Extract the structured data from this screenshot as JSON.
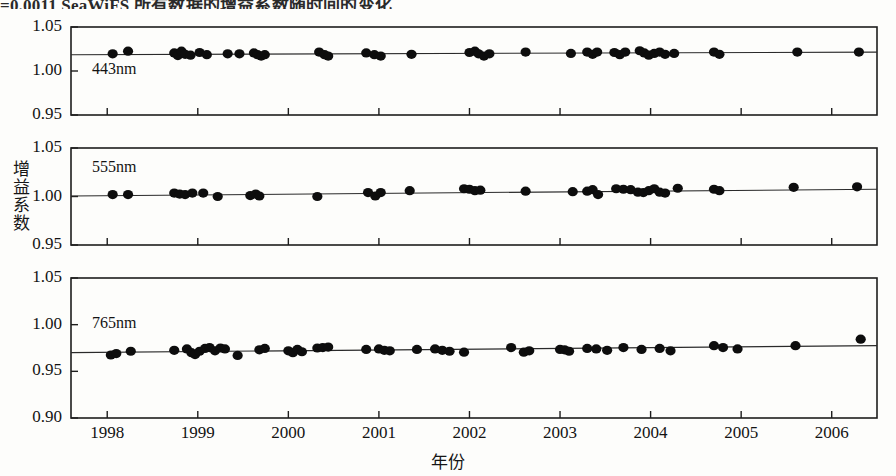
{
  "caption_fragment": "=0.0011  SeaWiFS 所有数据的增益系数随时间的变化",
  "axes": {
    "y_label": "增益系数",
    "x_label": "年份",
    "x_ticks": [
      "1998",
      "1999",
      "2000",
      "2001",
      "2002",
      "2003",
      "2004",
      "2005",
      "2006"
    ],
    "x_range": [
      1997.6,
      2006.5
    ],
    "y_ticks_upper": [
      "1.05",
      "1.00",
      "0.95"
    ],
    "y_ticks_lower": [
      "1.05",
      "1.00",
      "0.95",
      "0.90"
    ]
  },
  "chart_data": [
    {
      "type": "scatter",
      "title": "443nm",
      "panel_label": "443nm",
      "xlabel": "年份",
      "ylabel": "增益系数",
      "xlim": [
        1997.6,
        2006.5
      ],
      "ylim": [
        0.95,
        1.05
      ],
      "yticks": [
        0.95,
        1.0,
        1.05
      ],
      "grid": false,
      "trendline": {
        "x": [
          1997.6,
          2006.5
        ],
        "y": [
          1.0185,
          1.0215
        ]
      },
      "points": [
        {
          "x": 1998.06,
          "y": 1.0195
        },
        {
          "x": 1998.23,
          "y": 1.0225
        },
        {
          "x": 1998.74,
          "y": 1.0205
        },
        {
          "x": 1998.78,
          "y": 1.0175
        },
        {
          "x": 1998.82,
          "y": 1.0225
        },
        {
          "x": 1998.86,
          "y": 1.019
        },
        {
          "x": 1998.92,
          "y": 1.018
        },
        {
          "x": 1999.02,
          "y": 1.021
        },
        {
          "x": 1999.1,
          "y": 1.0185
        },
        {
          "x": 1999.33,
          "y": 1.0195
        },
        {
          "x": 1999.46,
          "y": 1.0195
        },
        {
          "x": 1999.62,
          "y": 1.0205
        },
        {
          "x": 1999.66,
          "y": 1.0185
        },
        {
          "x": 1999.7,
          "y": 1.017
        },
        {
          "x": 1999.74,
          "y": 1.0185
        },
        {
          "x": 2000.34,
          "y": 1.0215
        },
        {
          "x": 2000.4,
          "y": 1.0185
        },
        {
          "x": 2000.44,
          "y": 1.017
        },
        {
          "x": 2000.86,
          "y": 1.0205
        },
        {
          "x": 2000.95,
          "y": 1.0185
        },
        {
          "x": 2001.02,
          "y": 1.017
        },
        {
          "x": 2001.36,
          "y": 1.019
        },
        {
          "x": 2002.0,
          "y": 1.021
        },
        {
          "x": 2002.06,
          "y": 1.0225
        },
        {
          "x": 2002.1,
          "y": 1.0195
        },
        {
          "x": 2002.16,
          "y": 1.017
        },
        {
          "x": 2002.22,
          "y": 1.0195
        },
        {
          "x": 2002.62,
          "y": 1.0215
        },
        {
          "x": 2003.12,
          "y": 1.02
        },
        {
          "x": 2003.3,
          "y": 1.0215
        },
        {
          "x": 2003.36,
          "y": 1.019
        },
        {
          "x": 2003.41,
          "y": 1.0215
        },
        {
          "x": 2003.6,
          "y": 1.021
        },
        {
          "x": 2003.66,
          "y": 1.0185
        },
        {
          "x": 2003.72,
          "y": 1.0215
        },
        {
          "x": 2003.88,
          "y": 1.023
        },
        {
          "x": 2003.93,
          "y": 1.0205
        },
        {
          "x": 2003.98,
          "y": 1.018
        },
        {
          "x": 2004.04,
          "y": 1.02
        },
        {
          "x": 2004.1,
          "y": 1.0215
        },
        {
          "x": 2004.16,
          "y": 1.019
        },
        {
          "x": 2004.26,
          "y": 1.02
        },
        {
          "x": 2004.7,
          "y": 1.0215
        },
        {
          "x": 2004.76,
          "y": 1.019
        },
        {
          "x": 2005.62,
          "y": 1.0215
        },
        {
          "x": 2006.3,
          "y": 1.0215
        }
      ]
    },
    {
      "type": "scatter",
      "title": "555nm",
      "panel_label": "555nm",
      "xlabel": "年份",
      "ylabel": "增益系数",
      "xlim": [
        1997.6,
        2006.5
      ],
      "ylim": [
        0.95,
        1.05
      ],
      "yticks": [
        0.95,
        1.0,
        1.05
      ],
      "grid": false,
      "trendline": {
        "x": [
          1997.6,
          2006.5
        ],
        "y": [
          1.0005,
          1.0075
        ]
      },
      "points": [
        {
          "x": 1998.06,
          "y": 1.002
        },
        {
          "x": 1998.23,
          "y": 1.002
        },
        {
          "x": 1998.74,
          "y": 1.0035
        },
        {
          "x": 1998.8,
          "y": 1.0025
        },
        {
          "x": 1998.86,
          "y": 1.002
        },
        {
          "x": 1998.94,
          "y": 1.0035
        },
        {
          "x": 1999.06,
          "y": 1.0035
        },
        {
          "x": 1999.22,
          "y": 1.0
        },
        {
          "x": 1999.58,
          "y": 1.001
        },
        {
          "x": 1999.64,
          "y": 1.0025
        },
        {
          "x": 1999.68,
          "y": 1.0005
        },
        {
          "x": 2000.32,
          "y": 1.0
        },
        {
          "x": 2000.88,
          "y": 1.004
        },
        {
          "x": 2000.96,
          "y": 1.0005
        },
        {
          "x": 2001.02,
          "y": 1.004
        },
        {
          "x": 2001.34,
          "y": 1.006
        },
        {
          "x": 2001.94,
          "y": 1.008
        },
        {
          "x": 2002.0,
          "y": 1.0075
        },
        {
          "x": 2002.06,
          "y": 1.006
        },
        {
          "x": 2002.12,
          "y": 1.0065
        },
        {
          "x": 2002.62,
          "y": 1.0055
        },
        {
          "x": 2003.14,
          "y": 1.005
        },
        {
          "x": 2003.3,
          "y": 1.0055
        },
        {
          "x": 2003.36,
          "y": 1.007
        },
        {
          "x": 2003.42,
          "y": 1.002
        },
        {
          "x": 2003.62,
          "y": 1.008
        },
        {
          "x": 2003.7,
          "y": 1.0075
        },
        {
          "x": 2003.78,
          "y": 1.007
        },
        {
          "x": 2003.86,
          "y": 1.0045
        },
        {
          "x": 2003.92,
          "y": 1.004
        },
        {
          "x": 2003.98,
          "y": 1.006
        },
        {
          "x": 2004.04,
          "y": 1.008
        },
        {
          "x": 2004.1,
          "y": 1.0045
        },
        {
          "x": 2004.16,
          "y": 1.0035
        },
        {
          "x": 2004.3,
          "y": 1.0085
        },
        {
          "x": 2004.7,
          "y": 1.0075
        },
        {
          "x": 2004.76,
          "y": 1.006
        },
        {
          "x": 2005.58,
          "y": 1.0095
        },
        {
          "x": 2006.28,
          "y": 1.01
        }
      ]
    },
    {
      "type": "scatter",
      "title": "765nm",
      "panel_label": "765nm",
      "xlabel": "年份",
      "ylabel": "增益系数",
      "xlim": [
        1997.6,
        2006.5
      ],
      "ylim": [
        0.9,
        1.05
      ],
      "yticks": [
        0.9,
        0.95,
        1.0,
        1.05
      ],
      "grid": false,
      "trendline": {
        "x": [
          1997.6,
          2006.5
        ],
        "y": [
          0.97,
          0.9775
        ]
      },
      "points": [
        {
          "x": 1998.04,
          "y": 0.9675
        },
        {
          "x": 1998.1,
          "y": 0.969
        },
        {
          "x": 1998.26,
          "y": 0.9715
        },
        {
          "x": 1998.74,
          "y": 0.9725
        },
        {
          "x": 1998.88,
          "y": 0.974
        },
        {
          "x": 1998.93,
          "y": 0.97
        },
        {
          "x": 1998.97,
          "y": 0.968
        },
        {
          "x": 1999.02,
          "y": 0.9715
        },
        {
          "x": 1999.08,
          "y": 0.9745
        },
        {
          "x": 1999.13,
          "y": 0.9755
        },
        {
          "x": 1999.19,
          "y": 0.972
        },
        {
          "x": 1999.25,
          "y": 0.975
        },
        {
          "x": 1999.3,
          "y": 0.974
        },
        {
          "x": 1999.44,
          "y": 0.967
        },
        {
          "x": 1999.68,
          "y": 0.973
        },
        {
          "x": 1999.74,
          "y": 0.9745
        },
        {
          "x": 2000.0,
          "y": 0.972
        },
        {
          "x": 2000.05,
          "y": 0.97
        },
        {
          "x": 2000.1,
          "y": 0.9735
        },
        {
          "x": 2000.15,
          "y": 0.971
        },
        {
          "x": 2000.32,
          "y": 0.975
        },
        {
          "x": 2000.38,
          "y": 0.9755
        },
        {
          "x": 2000.44,
          "y": 0.976
        },
        {
          "x": 2000.86,
          "y": 0.9735
        },
        {
          "x": 2001.0,
          "y": 0.974
        },
        {
          "x": 2001.06,
          "y": 0.9725
        },
        {
          "x": 2001.12,
          "y": 0.972
        },
        {
          "x": 2001.42,
          "y": 0.9735
        },
        {
          "x": 2001.62,
          "y": 0.974
        },
        {
          "x": 2001.7,
          "y": 0.9725
        },
        {
          "x": 2001.78,
          "y": 0.9715
        },
        {
          "x": 2001.94,
          "y": 0.9705
        },
        {
          "x": 2002.46,
          "y": 0.9755
        },
        {
          "x": 2002.6,
          "y": 0.9705
        },
        {
          "x": 2002.66,
          "y": 0.972
        },
        {
          "x": 2003.0,
          "y": 0.9735
        },
        {
          "x": 2003.05,
          "y": 0.973
        },
        {
          "x": 2003.1,
          "y": 0.9715
        },
        {
          "x": 2003.3,
          "y": 0.9745
        },
        {
          "x": 2003.4,
          "y": 0.974
        },
        {
          "x": 2003.52,
          "y": 0.9725
        },
        {
          "x": 2003.7,
          "y": 0.9755
        },
        {
          "x": 2003.9,
          "y": 0.9735
        },
        {
          "x": 2004.1,
          "y": 0.9745
        },
        {
          "x": 2004.22,
          "y": 0.972
        },
        {
          "x": 2004.7,
          "y": 0.9775
        },
        {
          "x": 2004.8,
          "y": 0.9755
        },
        {
          "x": 2004.96,
          "y": 0.974
        },
        {
          "x": 2005.6,
          "y": 0.9775
        },
        {
          "x": 2006.32,
          "y": 0.9845
        }
      ]
    }
  ]
}
